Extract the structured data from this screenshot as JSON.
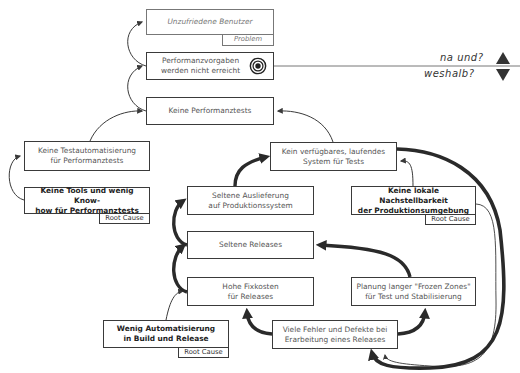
{
  "diagram": {
    "boxes": {
      "unzufriedene": {
        "label": "Unzufriedene Benutzer",
        "tag": "Problem"
      },
      "vorgaben": {
        "line1": "Performanzvorgaben",
        "line2": "werden nicht erreicht"
      },
      "keine_tests": {
        "label": "Keine Performanztests"
      },
      "testautomatisierung": {
        "line1": "Keine Testautomatisierung",
        "line2": "für Performanztests"
      },
      "tools": {
        "line1": "Keine Tools und wenig Know-",
        "line2": "how für Performanztests",
        "tag": "Root Cause"
      },
      "kein_system": {
        "line1": "Kein verfügbares, laufendes",
        "line2": "System für Tests"
      },
      "auslieferung": {
        "line1": "Seltene Auslieferung",
        "line2": "auf Produktionssystem"
      },
      "nachstellbarkeit": {
        "line1": "Keine lokale Nachstellbarkeit",
        "line2": "der Produktionsumgebung",
        "tag": "Root Cause"
      },
      "seltene_releases": {
        "label": "Seltene Releases"
      },
      "fixkosten": {
        "line1": "Hohe Fixkosten",
        "line2": "für Releases"
      },
      "frozen": {
        "line1": "Planung langer \"Frozen Zones\"",
        "line2": "für Test und Stabilisierung"
      },
      "automatisierung": {
        "line1": "Wenig Automatisierung",
        "line2": "in Build und Release",
        "tag": "Root Cause"
      },
      "fehler": {
        "line1": "Viele Fehler und Defekte bei",
        "line2": "Erarbeitung eines Releases"
      }
    },
    "side_labels": {
      "up": "na und?",
      "down": "weshalb?"
    },
    "icons": {
      "target": "target-icon",
      "up": "triangle-up-icon",
      "down": "triangle-down-icon"
    },
    "colors": {
      "line": "#3a3a3a",
      "thick_line": "#2a2a2a",
      "muted": "#777777"
    }
  }
}
